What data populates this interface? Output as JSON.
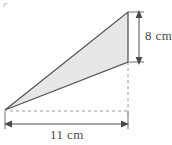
{
  "figure": {
    "type": "geometry-diagram",
    "shape": "triangle",
    "fill_color": "#e7e7e7",
    "stroke_color": "#555555",
    "dimension_color": "#4a4a4a",
    "dashed_color": "#9a9a9a",
    "corner_mark": "c",
    "labels": {
      "height": "8 cm",
      "base": "11 cm"
    },
    "measurements": {
      "height_value": 8,
      "height_unit": "cm",
      "base_value": 11,
      "base_unit": "cm"
    },
    "geometry": {
      "triangle_points": "5,110 128,12 128,62",
      "vertices": [
        {
          "name": "left-vertex",
          "x": 5,
          "y": 110
        },
        {
          "name": "apex-vertex",
          "x": 128,
          "y": 12
        },
        {
          "name": "right-lower-vertex",
          "x": 128,
          "y": 62
        }
      ],
      "height_arrow": {
        "x": 139,
        "y1": 13,
        "y2": 62
      },
      "base_arrow": {
        "y": 124,
        "x1": 5,
        "x2": 128
      },
      "dashed_vertical": {
        "x": 128,
        "y1": 62,
        "y2": 112
      },
      "dashed_horizontal": {
        "y": 111,
        "x1": 5,
        "x2": 128
      }
    }
  }
}
